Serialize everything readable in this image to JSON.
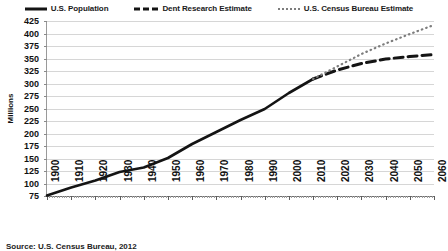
{
  "chart_data": {
    "type": "line",
    "title": "",
    "xlabel": "",
    "ylabel": "Millions",
    "xlim": [
      1900,
      2060
    ],
    "ylim": [
      75,
      425
    ],
    "ytick_step": 25,
    "grid": true,
    "legend_position": "top",
    "yticks": [
      425,
      400,
      375,
      350,
      325,
      300,
      275,
      250,
      225,
      200,
      175,
      150,
      125,
      100,
      75
    ],
    "xticks": [
      1900,
      1910,
      1920,
      1930,
      1940,
      1950,
      1960,
      1970,
      1980,
      1990,
      2000,
      2010,
      2020,
      2030,
      2040,
      2050,
      2060
    ],
    "series": [
      {
        "name": "U.S. Population",
        "style": "solid",
        "color": "#141414",
        "x": [
          1900,
          1910,
          1920,
          1930,
          1940,
          1950,
          1960,
          1970,
          1980,
          1990,
          2000,
          2010
        ],
        "values": [
          76,
          92,
          106,
          123,
          132,
          151,
          179,
          203,
          227,
          249,
          281,
          309
        ]
      },
      {
        "name": "Dent Research Estimate",
        "style": "dashed",
        "color": "#141414",
        "x": [
          2010,
          2020,
          2030,
          2040,
          2050,
          2060
        ],
        "values": [
          309,
          327,
          340,
          349,
          354,
          358
        ]
      },
      {
        "name": "U.S. Census Bureau Estimate",
        "style": "dotted",
        "color": "#7d7d7d",
        "x": [
          2010,
          2020,
          2030,
          2040,
          2050,
          2060
        ],
        "values": [
          309,
          334,
          359,
          380,
          399,
          417
        ]
      }
    ]
  },
  "legend": {
    "items": [
      {
        "label": "U.S. Population",
        "marker": "solid-line-marker"
      },
      {
        "label": "Dent Research Estimate",
        "marker": "dashed-line-marker"
      },
      {
        "label": "U.S. Census Bureau Estimate",
        "marker": "dotted-line-marker"
      }
    ]
  },
  "source": "Source: U.S. Census Bureau, 2012"
}
